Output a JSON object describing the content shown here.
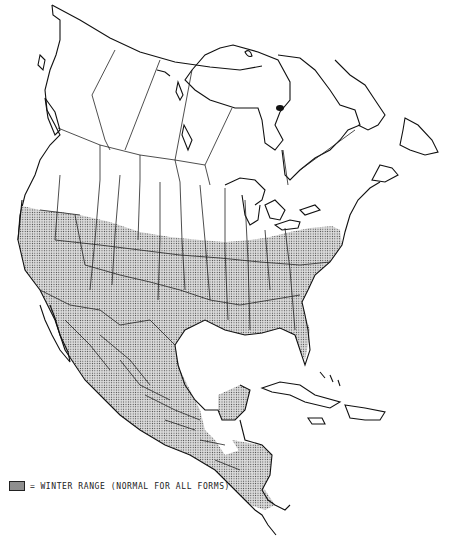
{
  "map": {
    "title": "",
    "region": "North America",
    "style": "black-and-white outline map with stippled range shading",
    "range_fill_color": "#d0d0d0",
    "stipple_color": "#333333",
    "outline_color": "#111111",
    "shaded_regions": [
      "southern United States",
      "Mexico",
      "Central America"
    ]
  },
  "legend": {
    "items": [
      {
        "symbol": "stippled-swatch",
        "separator": "=",
        "label": "WINTER RANGE (NORMAL FOR ALL FORMS)"
      }
    ]
  }
}
